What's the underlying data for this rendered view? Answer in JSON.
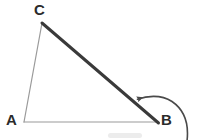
{
  "figure": {
    "width": 203,
    "height": 140,
    "background_color": "#ffffff"
  },
  "labels": {
    "vertex_a": "A",
    "vertex_b": "B",
    "vertex_c": "C"
  },
  "geometry": {
    "points": {
      "A": {
        "x": 24,
        "y": 122
      },
      "B": {
        "x": 158,
        "y": 122
      },
      "C": {
        "x": 42,
        "y": 23
      }
    },
    "segments": [
      {
        "name": "side-AC",
        "from": "A",
        "to": "C",
        "color": "#9a9a9a",
        "width": 1
      },
      {
        "name": "side-AB",
        "from": "A",
        "to": "B",
        "color": "#9a9a9a",
        "width": 1
      },
      {
        "name": "side-CB",
        "from": "C",
        "to": "B",
        "color": "#3a3a3a",
        "width": 3
      }
    ],
    "arrow": {
      "name": "exterior-angle-arrow",
      "color": "#4a4a4a",
      "width": 1.6,
      "path": "M 186 140 C 188 124 184 110 172 102 C 160 94 146 96 136 99",
      "tip": {
        "x": 133,
        "y": 99
      },
      "direction": "left"
    },
    "smudge": {
      "name": "paper-smudge",
      "x": 108,
      "y": 133,
      "width": 34,
      "height": 5,
      "color": "#e8e8e8"
    }
  }
}
